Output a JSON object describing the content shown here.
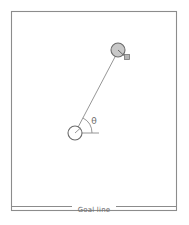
{
  "figure": {
    "width": 189,
    "height": 225,
    "background_color": "#ffffff"
  },
  "border": {
    "name": "plot-frame",
    "x": 11.5,
    "y": 11.5,
    "width": 165,
    "height": 199,
    "stroke_color": "#8c8c8c",
    "stroke_width": 1.1,
    "fill": "none"
  },
  "ball": {
    "label": "",
    "cx": 118,
    "cy": 50,
    "r": 7,
    "fill_color": "#c8c8c8",
    "stroke_color": "#6b6b6b",
    "stroke_width": 1.1
  },
  "ball_marker": {
    "label": "",
    "x": 124.5,
    "y": 54.5,
    "width": 5,
    "height": 5,
    "fill_color": "#b4b4b4",
    "stroke_color": "#767676"
  },
  "ball_spoke": {
    "x1": 118,
    "y1": 50,
    "x2": 124.5,
    "y2": 56,
    "stroke_color": "#5a5a5a"
  },
  "player": {
    "label": "",
    "cx": 75,
    "cy": 133,
    "r": 7,
    "fill_color": "#ffffff",
    "stroke_color": "#6b6b6b",
    "stroke_width": 1.1
  },
  "player_tick": {
    "x1": 75,
    "y1": 133,
    "x2": 80.5,
    "y2": 128,
    "stroke_color": "#8c8c8c"
  },
  "shot_line": {
    "name": "shot-trajectory",
    "x1": 75,
    "y1": 133,
    "x2": 116,
    "y2": 55,
    "stroke_color": "#8a8a8a",
    "stroke_width": 0.9
  },
  "reference_line": {
    "name": "horizontal-reference",
    "x1": 75,
    "y1": 133,
    "x2": 99,
    "y2": 133,
    "stroke_color": "#8a8a8a",
    "stroke_width": 0.9
  },
  "angle": {
    "symbol": "θ",
    "label_x": 94,
    "label_y": 121,
    "arc_radius": 17,
    "stroke_color": "#8a8a8a"
  },
  "goal_line": {
    "label": "Goal line",
    "label_x": 94,
    "label_y": 210,
    "y": 206.5,
    "left_segment": {
      "x1": 11.5,
      "x2": 72
    },
    "right_segment": {
      "x1": 116,
      "x2": 176.5
    },
    "stroke_color": "#8c8c8c",
    "stroke_width": 1.1
  },
  "colors": {
    "frame": "#8c8c8c",
    "line": "#8a8a8a",
    "ball_fill": "#c8c8c8",
    "text": "#6e6e6e",
    "background": "#ffffff"
  }
}
